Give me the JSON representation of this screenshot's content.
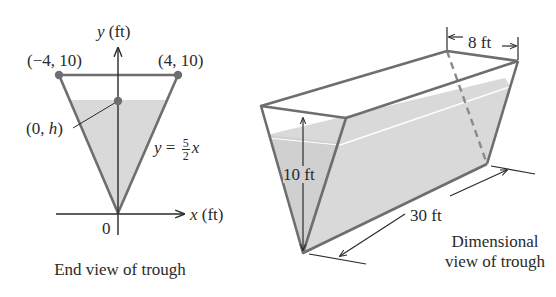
{
  "colors": {
    "edge": "#6e6e6e",
    "water": "#d9d9d9",
    "dot": "#6e6e6e",
    "axis": "#2a2a2a",
    "text": "#2a2a2a"
  },
  "end_view": {
    "y_axis_label_var": "y",
    "y_axis_label_unit": "(ft)",
    "x_axis_label_var": "x",
    "x_axis_label_unit": "(ft)",
    "origin_label": "0",
    "point_left": "(−4, 10)",
    "point_right": "(4, 10)",
    "point_h_prefix": "(0, ",
    "point_h_var": "h",
    "point_h_suffix": ")",
    "equation_lhs": "y",
    "equation_eq": "=",
    "equation_num": "5",
    "equation_den": "2",
    "equation_var": "x",
    "caption": "End view of trough"
  },
  "dimensional_view": {
    "width_label": "8 ft",
    "height_label": "10 ft",
    "length_label": "30 ft",
    "caption_line1": "Dimensional",
    "caption_line2": "view of trough"
  }
}
